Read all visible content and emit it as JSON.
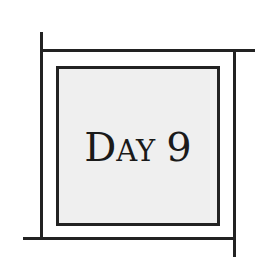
{
  "badge": {
    "title_first_letter": "D",
    "title_rest": "ay",
    "number": "9",
    "full_text": "Day 9"
  },
  "colors": {
    "frame_lines": "#222222",
    "inner_fill": "#efefef",
    "text": "#1a1a1a",
    "background": "#ffffff"
  }
}
